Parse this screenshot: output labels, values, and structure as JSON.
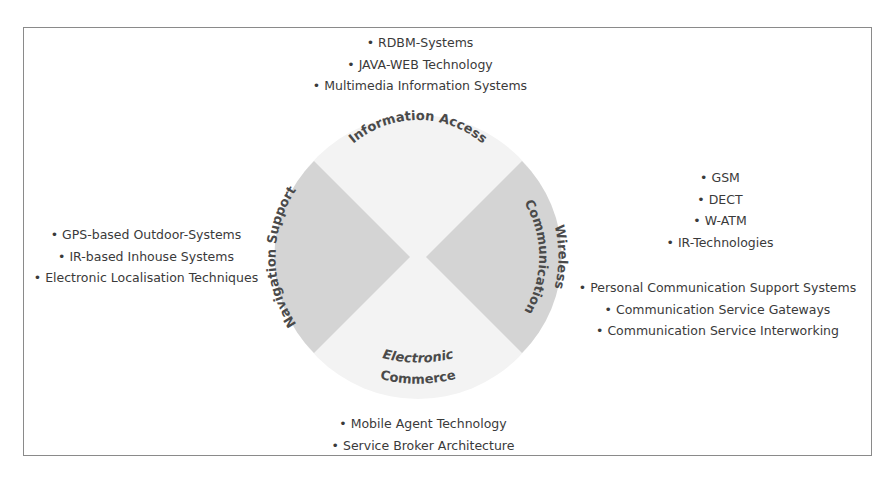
{
  "diagram": {
    "segments": {
      "top": {
        "label": "Information Access"
      },
      "left": {
        "label": "Navigation Support"
      },
      "right": {
        "label_line1": "Wireless",
        "label_line2": "Communication"
      },
      "bottom": {
        "label_line1": "Electronic",
        "label_line2": "Commerce"
      }
    },
    "colors": {
      "wedge_fill": "#d4d4d4",
      "circle_fill": "#f3f3f3",
      "frame": "#8a8a8a",
      "text": "#3a3a3a"
    }
  },
  "lists": {
    "top": [
      "RDBM-Systems",
      "JAVA-WEB Technology",
      "Multimedia Information Systems"
    ],
    "left": [
      "GPS-based Outdoor-Systems",
      "IR-based Inhouse Systems",
      "Electronic Localisation Techniques"
    ],
    "right_a": [
      "GSM",
      "DECT",
      "W-ATM",
      "IR-Technologies"
    ],
    "right_b": [
      "Personal Communication Support Systems",
      "Communication Service Gateways",
      "Communication Service Interworking"
    ],
    "bottom": [
      "Mobile Agent Technology",
      "Service Broker Architecture"
    ]
  }
}
